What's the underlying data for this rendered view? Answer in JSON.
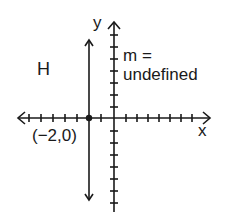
{
  "diagram": {
    "type": "coordinate-plane",
    "axes": {
      "x_label": "x",
      "y_label": "y"
    },
    "line_label": "H",
    "point_label": "(−2,0)",
    "slope_label_line1": "m =",
    "slope_label_line2": "undefined",
    "line": {
      "equation": "x = -2",
      "slope": "undefined",
      "orientation": "vertical"
    },
    "point": {
      "x": -2,
      "y": 0
    },
    "colors": {
      "ink": "#1a1a1a",
      "background": "#ffffff"
    }
  }
}
